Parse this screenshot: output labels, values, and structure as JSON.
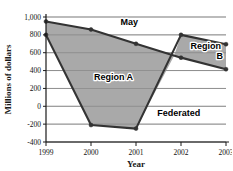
{
  "chart_data": {
    "type": "area",
    "title": "",
    "xlabel": "Year",
    "ylabel": "Millions of dollars",
    "x": [
      1999,
      2000,
      2001,
      2002,
      2003
    ],
    "xtick_labels": [
      "1999",
      "2000",
      "2001",
      "2002",
      "2003"
    ],
    "xlim": [
      1999,
      2003
    ],
    "ylim": [
      -400,
      1000
    ],
    "ytick_values": [
      1000,
      800,
      600,
      400,
      200,
      0,
      -200,
      -400
    ],
    "ytick_labels": [
      "1,000",
      "800",
      "600",
      "400",
      "200",
      "0",
      "-200",
      "-400"
    ],
    "grid": true,
    "grid_axis": "y",
    "legend": "inline-annotations",
    "series": [
      {
        "name": "May",
        "values": [
          950,
          860,
          700,
          545,
          415
        ]
      },
      {
        "name": "Federated",
        "values": [
          800,
          -210,
          -250,
          800,
          695
        ]
      }
    ],
    "annotations": [
      {
        "label": "May",
        "x": 2000.85,
        "y": 905
      },
      {
        "label": "Region A",
        "x": 2000.5,
        "y": 290
      },
      {
        "label": "Federated",
        "x": 2001.95,
        "y": -105
      },
      {
        "label": "Region",
        "x": 2002.55,
        "y": 640
      },
      {
        "label": "B",
        "x": 2002.86,
        "y": 530
      }
    ],
    "regions": [
      {
        "name": "Region A",
        "description": "Area between May and Federated where May exceeds Federated, 1999 to crossing point"
      },
      {
        "name": "Region B",
        "description": "Area between Federated and May where Federated exceeds May, crossing point to 2003"
      }
    ],
    "crossing_x": 2001.85,
    "colors": {
      "fill": "#a9a9a9",
      "line": "#333333",
      "grid": "#808080",
      "axis": "#1a1a1a",
      "background": "#ffffff",
      "text": "#000000"
    }
  }
}
